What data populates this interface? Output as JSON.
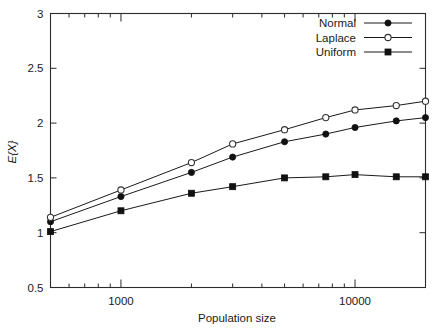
{
  "chart_data": {
    "type": "line",
    "title": "",
    "xlabel": "Population size",
    "ylabel": "E{X}",
    "xscale": "log",
    "yscale": "linear",
    "xlim": [
      500,
      20000
    ],
    "ylim": [
      0.5,
      3
    ],
    "ytick_labels": [
      "3",
      "2.5",
      "2",
      "1.5",
      "1",
      "0.5"
    ],
    "ytick_values": [
      3,
      2.5,
      2,
      1.5,
      1,
      0.5
    ],
    "xtick_labels": [
      "1000",
      "10000"
    ],
    "xtick_values": [
      1000,
      10000
    ],
    "xminor_ticks": [
      600,
      700,
      800,
      900,
      2000,
      3000,
      4000,
      5000,
      6000,
      7000,
      8000,
      9000,
      20000
    ],
    "grid": false,
    "legend_position": "top-right",
    "x": [
      500,
      1000,
      2000,
      3000,
      5000,
      7500,
      10000,
      15000,
      20000
    ],
    "series": [
      {
        "name": "Normal",
        "marker": "filled-circle",
        "values": [
          1.1,
          1.33,
          1.55,
          1.69,
          1.83,
          1.9,
          1.96,
          2.02,
          2.05
        ]
      },
      {
        "name": "Laplace",
        "marker": "open-circle",
        "values": [
          1.14,
          1.39,
          1.64,
          1.81,
          1.94,
          2.05,
          2.12,
          2.16,
          2.2
        ]
      },
      {
        "name": "Uniform",
        "marker": "filled-square",
        "values": [
          1.01,
          1.2,
          1.36,
          1.42,
          1.5,
          1.51,
          1.53,
          1.51,
          1.51
        ]
      }
    ],
    "colors": {
      "line": "#1a1a1a",
      "frame": "#2b2b2b",
      "background": "#ffffff",
      "marker_fill": "#111111",
      "marker_open_fill": "#ffffff"
    }
  },
  "legend": {
    "entries": [
      {
        "label": "Normal"
      },
      {
        "label": "Laplace"
      },
      {
        "label": "Uniform"
      }
    ]
  }
}
